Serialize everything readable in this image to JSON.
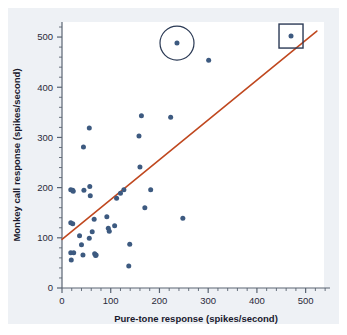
{
  "chart_data": {
    "type": "scatter",
    "title": "",
    "xlabel": "Pure-tone response (spikes/second)",
    "ylabel": "Monkey call response (spikes/second)",
    "xlim": [
      0,
      550
    ],
    "ylim": [
      0,
      530
    ],
    "xticks": [
      0,
      100,
      200,
      300,
      400,
      500
    ],
    "yticks": [
      0,
      100,
      200,
      300,
      400,
      500
    ],
    "xtick_labels": [
      "0",
      "100",
      "200",
      "300",
      "400",
      "500"
    ],
    "ytick_labels": [
      "0",
      "100",
      "200",
      "300",
      "400",
      "500"
    ],
    "grid": false,
    "legend": "none",
    "point_color": "#3d5a80",
    "line_color": "#c0481f",
    "axis_color": "#5a6472",
    "background_color": "#eef1f5",
    "plot_background_color": "#ffffff",
    "series": [
      {
        "name": "Neuron responses",
        "points": [
          [
            18,
            196
          ],
          [
            22,
            195
          ],
          [
            23,
            193
          ],
          [
            45,
            195
          ],
          [
            18,
            130
          ],
          [
            22,
            128
          ],
          [
            18,
            70
          ],
          [
            24,
            70
          ],
          [
            19,
            56
          ],
          [
            36,
            104
          ],
          [
            40,
            86
          ],
          [
            44,
            281
          ],
          [
            43,
            66
          ],
          [
            56,
            319
          ],
          [
            57,
            202
          ],
          [
            58,
            184
          ],
          [
            56,
            99
          ],
          [
            62,
            112
          ],
          [
            66,
            137
          ],
          [
            67,
            68
          ],
          [
            69,
            65
          ],
          [
            70,
            66
          ],
          [
            92,
            142
          ],
          [
            95,
            119
          ],
          [
            97,
            113
          ],
          [
            108,
            124
          ],
          [
            112,
            179
          ],
          [
            120,
            189
          ],
          [
            127,
            196
          ],
          [
            137,
            44
          ],
          [
            139,
            87
          ],
          [
            158,
            303
          ],
          [
            160,
            241
          ],
          [
            163,
            343
          ],
          [
            170,
            160
          ],
          [
            182,
            196
          ],
          [
            223,
            340
          ],
          [
            236,
            488
          ],
          [
            248,
            139
          ],
          [
            301,
            454
          ],
          [
            470,
            502
          ]
        ]
      }
    ],
    "trend_line": {
      "x_start": 0,
      "y_start": 97,
      "x_end": 523,
      "y_end": 512
    },
    "annotations": [
      {
        "type": "circle",
        "x": 236,
        "y": 488,
        "radius_px": 17
      },
      {
        "type": "square",
        "x": 470,
        "y": 502,
        "size_px": 24
      }
    ]
  },
  "axis": {
    "xlabel": "Pure-tone response (spikes/second)",
    "ylabel": "Monkey call response (spikes/second)",
    "x0": "0",
    "x1": "100",
    "x2": "200",
    "x3": "300",
    "x4": "400",
    "x5": "500",
    "y0": "0",
    "y1": "100",
    "y2": "200",
    "y3": "300",
    "y4": "400",
    "y5": "500"
  }
}
